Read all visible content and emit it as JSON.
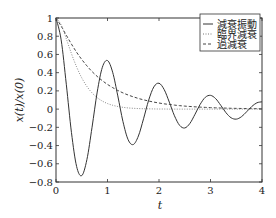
{
  "chart_data": {
    "type": "line",
    "title": "",
    "xlabel": "t",
    "ylabel": "x(t)/x(0)",
    "xlim": [
      0,
      4
    ],
    "ylim": [
      -0.8,
      1
    ],
    "grid": false,
    "legend_position": "upper right",
    "xticks": [
      0,
      1,
      2,
      3,
      4
    ],
    "xtick_labels": [
      "0",
      "1",
      "2",
      "3",
      "4"
    ],
    "yticks": [
      1,
      0.8,
      0.6,
      0.4,
      0.2,
      0,
      -0.2,
      -0.4,
      -0.6,
      -0.8
    ],
    "ytick_labels": [
      "1",
      "0.8",
      "0.6",
      "0.4",
      "0.2",
      "0",
      "−0.2",
      "−0.4",
      "−0.6",
      "−0.8"
    ],
    "x": [
      0,
      0.1,
      0.2,
      0.3,
      0.4,
      0.5,
      0.6,
      0.7,
      0.8,
      0.9,
      1.0,
      1.1,
      1.2,
      1.3,
      1.4,
      1.5,
      1.6,
      1.7,
      1.8,
      1.9,
      2.0,
      2.1,
      2.2,
      2.3,
      2.4,
      2.5,
      2.6,
      2.7,
      2.8,
      2.9,
      3.0,
      3.1,
      3.2,
      3.3,
      3.4,
      3.5,
      3.6,
      3.7,
      3.8,
      3.9,
      4.0
    ],
    "series": [
      {
        "name": "減衰振動",
        "style": "solid",
        "values": [
          1.0,
          0.76,
          0.273,
          -0.256,
          -0.629,
          -0.73,
          -0.554,
          -0.199,
          0.187,
          0.459,
          0.533,
          0.405,
          0.145,
          -0.136,
          -0.335,
          -0.389,
          -0.295,
          -0.106,
          0.099,
          0.244,
          0.284,
          0.215,
          0.077,
          -0.073,
          -0.178,
          -0.207,
          -0.157,
          -0.056,
          0.053,
          0.13,
          0.151,
          0.115,
          0.041,
          -0.039,
          -0.095,
          -0.11,
          -0.084,
          -0.03,
          0.028,
          0.069,
          0.08
        ]
      },
      {
        "name": "臨界減衰",
        "style": "dotted",
        "values": [
          1.0,
          0.925,
          0.772,
          0.609,
          0.463,
          0.343,
          0.249,
          0.178,
          0.126,
          0.088,
          0.061,
          0.042,
          0.029,
          0.02,
          0.013,
          0.009,
          0.006,
          0.004,
          0.003,
          0.002,
          0.001,
          0.001,
          0.0,
          0.0,
          0.0,
          0.0,
          0.0,
          0.0,
          0.0,
          0.0,
          0.0,
          0.0,
          0.0,
          0.0,
          0.0,
          0.0,
          0.0,
          0.0,
          0.0,
          0.0,
          0.0
        ]
      },
      {
        "name": "過減衰",
        "style": "dashed",
        "values": [
          1.0,
          0.911,
          0.811,
          0.714,
          0.624,
          0.545,
          0.475,
          0.412,
          0.359,
          0.312,
          0.271,
          0.236,
          0.205,
          0.178,
          0.155,
          0.135,
          0.117,
          0.102,
          0.089,
          0.077,
          0.067,
          0.058,
          0.051,
          0.044,
          0.038,
          0.033,
          0.029,
          0.025,
          0.022,
          0.019,
          0.016,
          0.014,
          0.012,
          0.011,
          0.009,
          0.008,
          0.007,
          0.006,
          0.005,
          0.005,
          0.004
        ]
      }
    ]
  },
  "legend": {
    "items": [
      {
        "label": "減衰振動",
        "style": "solid"
      },
      {
        "label": "臨界減衰",
        "style": "dotted"
      },
      {
        "label": "過減衰",
        "style": "dashed"
      }
    ]
  },
  "colors": {
    "line": "#333333",
    "axis": "#333333",
    "background": "#ffffff"
  }
}
